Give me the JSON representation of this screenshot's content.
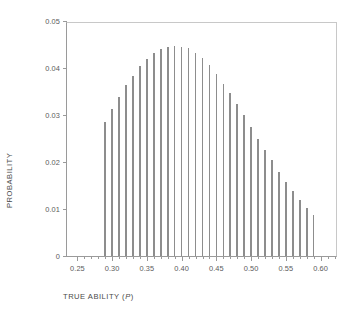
{
  "chart_data": {
    "type": "bar",
    "title": "",
    "subtitle": "",
    "xlabel": "TRUE ABILITY (P)",
    "xlabel_prefix": "TRUE ABILITY (",
    "xlabel_italic": "P",
    "xlabel_suffix": ")",
    "ylabel": "PROBABILITY",
    "xlim": [
      0.235,
      0.625
    ],
    "ylim": [
      0,
      0.05
    ],
    "grid": false,
    "legend": null,
    "x_tick_labels": [
      "0.25",
      "0.30",
      "0.35",
      "0.40",
      "0.45",
      "0.50",
      "0.55",
      "0.60"
    ],
    "x_tick_values": [
      0.25,
      0.3,
      0.35,
      0.4,
      0.45,
      0.5,
      0.55,
      0.6
    ],
    "x_minor_tick_values": [
      0.26,
      0.27,
      0.28,
      0.29,
      0.31,
      0.32,
      0.33,
      0.34,
      0.36,
      0.37,
      0.38,
      0.39,
      0.41,
      0.42,
      0.43,
      0.44,
      0.46,
      0.47,
      0.48,
      0.49,
      0.51,
      0.52,
      0.53,
      0.54,
      0.56,
      0.57,
      0.58,
      0.59,
      0.61,
      0.62
    ],
    "y_tick_labels": [
      "0",
      "0.01",
      "0.02",
      "0.03",
      "0.04",
      "0.05"
    ],
    "y_tick_values": [
      0,
      0.01,
      0.02,
      0.03,
      0.04,
      0.05
    ],
    "categories": [
      0.29,
      0.3,
      0.31,
      0.32,
      0.33,
      0.34,
      0.35,
      0.36,
      0.37,
      0.38,
      0.39,
      0.4,
      0.41,
      0.42,
      0.43,
      0.44,
      0.45,
      0.46,
      0.47,
      0.48,
      0.49,
      0.5,
      0.51,
      0.52,
      0.53,
      0.54,
      0.55,
      0.56,
      0.57,
      0.58,
      0.59
    ],
    "values": [
      0.0286,
      0.0312,
      0.0339,
      0.0363,
      0.0383,
      0.0404,
      0.0419,
      0.0431,
      0.044,
      0.0444,
      0.0447,
      0.0445,
      0.0443,
      0.0433,
      0.0421,
      0.0406,
      0.0388,
      0.0366,
      0.0347,
      0.0324,
      0.0301,
      0.0275,
      0.025,
      0.0226,
      0.0204,
      0.0179,
      0.0158,
      0.0138,
      0.012,
      0.0103,
      0.0088
    ],
    "bar_color": "#8d8d8d",
    "axis_color": "#9a9a9a",
    "text_color": "#5b5b5b"
  }
}
